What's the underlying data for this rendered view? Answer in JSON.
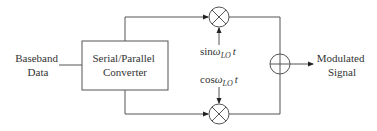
{
  "diagram": {
    "type": "block-diagram",
    "input_label": [
      "Baseband",
      "Data"
    ],
    "converter_label": [
      "Serial/Parallel",
      "Converter"
    ],
    "top_carrier": {
      "func": "sin",
      "sub": "LO",
      "var": "t"
    },
    "bottom_carrier": {
      "func": "cos",
      "sub": "LO",
      "var": "t"
    },
    "output_label": [
      "Modulated",
      "Signal"
    ],
    "colors": {
      "line": "#555555",
      "text": "#333333",
      "background": "#ffffff"
    }
  }
}
